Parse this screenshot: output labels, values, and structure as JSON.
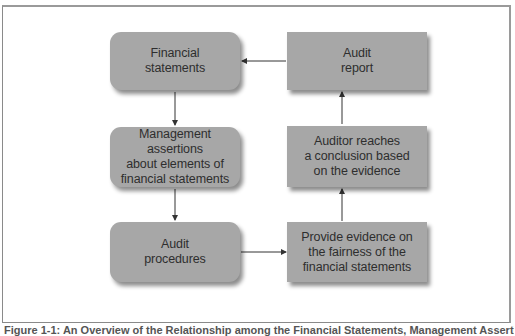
{
  "diagram": {
    "type": "flowchart",
    "nodes": [
      {
        "id": "financial-statements",
        "label": "Financial\nstatements",
        "shape": "rounded",
        "column": "left",
        "row": 1
      },
      {
        "id": "management-assertions",
        "label": "Management assertions\nabout elements of\nfinancial statements",
        "shape": "rounded",
        "column": "left",
        "row": 2
      },
      {
        "id": "audit-procedures",
        "label": "Audit\nprocedures",
        "shape": "rounded",
        "column": "left",
        "row": 3
      },
      {
        "id": "provide-evidence",
        "label": "Provide evidence on\nthe fairness of the\nfinancial statements",
        "shape": "square",
        "column": "right",
        "row": 3
      },
      {
        "id": "auditor-conclusion",
        "label": "Auditor reaches\na conclusion based\non the evidence",
        "shape": "square",
        "column": "right",
        "row": 2
      },
      {
        "id": "audit-report",
        "label": "Audit\nreport",
        "shape": "square",
        "column": "right",
        "row": 1
      }
    ],
    "edges": [
      {
        "from": "financial-statements",
        "to": "management-assertions"
      },
      {
        "from": "management-assertions",
        "to": "audit-procedures"
      },
      {
        "from": "audit-procedures",
        "to": "provide-evidence"
      },
      {
        "from": "provide-evidence",
        "to": "auditor-conclusion"
      },
      {
        "from": "auditor-conclusion",
        "to": "audit-report"
      },
      {
        "from": "audit-report",
        "to": "financial-statements"
      }
    ],
    "colors": {
      "node_fill": "#a7a7a7",
      "node_text": "#2e2e2e",
      "connector": "#333333",
      "frame": "#8a8a8a",
      "background": "#ffffff"
    }
  },
  "caption": {
    "text": "Figure 1-1: An Overview of the Relationship among the Financial Statements, Management Assertions, and the Audit",
    "clipped": true
  }
}
